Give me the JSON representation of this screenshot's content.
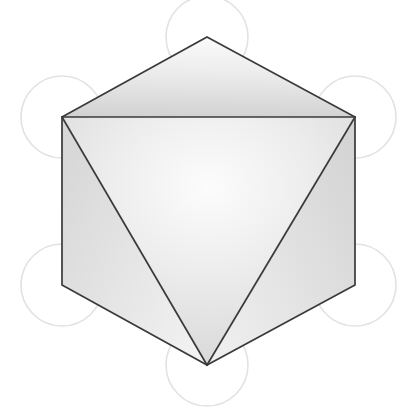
{
  "figure": {
    "canvas": {
      "width": 402,
      "height": 411,
      "background": "#ffffff"
    },
    "colors": {
      "edge_stroke": "#3a3a3a",
      "circle_stroke": "#e2e2e2",
      "face_light": "#fbfbfb",
      "face_mid": "#e2e2e2",
      "face_dark": "#b8b8b8",
      "background": "#ffffff"
    },
    "stroke_widths": {
      "edge": 1.7,
      "circle": 1.6
    },
    "outline": {
      "name": "hexagon-silhouette",
      "vertices": [
        {
          "label": "top-apex",
          "x": 207,
          "y": 37
        },
        {
          "label": "upper-right",
          "x": 355,
          "y": 117
        },
        {
          "label": "lower-right",
          "x": 355,
          "y": 285
        },
        {
          "label": "bottom-apex",
          "x": 207,
          "y": 365
        },
        {
          "label": "lower-left",
          "x": 62,
          "y": 285
        },
        {
          "label": "upper-left",
          "x": 62,
          "y": 117
        }
      ]
    },
    "internal_edges": [
      {
        "name": "equator-horizontal",
        "x1": 62,
        "y1": 117,
        "x2": 355,
        "y2": 117
      },
      {
        "name": "left-diagonal-to-bottom",
        "x1": 62,
        "y1": 117,
        "x2": 207,
        "y2": 365
      },
      {
        "name": "right-diagonal-to-bottom",
        "x1": 355,
        "y1": 117,
        "x2": 207,
        "y2": 365
      }
    ],
    "faces": [
      {
        "name": "top-face",
        "points": "207,37 355,117 62,117",
        "shade": "top"
      },
      {
        "name": "left-face",
        "points": "62,117 207,365 62,285",
        "shade": "left"
      },
      {
        "name": "right-face",
        "points": "355,117 355,285 207,365",
        "shade": "right"
      },
      {
        "name": "center-face",
        "points": "62,117 355,117 207,365",
        "shade": "center"
      }
    ],
    "lattice_circles": [
      {
        "name": "circle-top",
        "cx": 207,
        "cy": 37,
        "r": 41
      },
      {
        "name": "circle-upper-left",
        "cx": 62,
        "cy": 117,
        "r": 41
      },
      {
        "name": "circle-upper-right",
        "cx": 355,
        "cy": 117,
        "r": 41
      },
      {
        "name": "circle-lower-left",
        "cx": 62,
        "cy": 285,
        "r": 41
      },
      {
        "name": "circle-lower-right",
        "cx": 355,
        "cy": 285,
        "r": 41
      },
      {
        "name": "circle-bottom",
        "cx": 207,
        "cy": 365,
        "r": 41
      }
    ]
  }
}
